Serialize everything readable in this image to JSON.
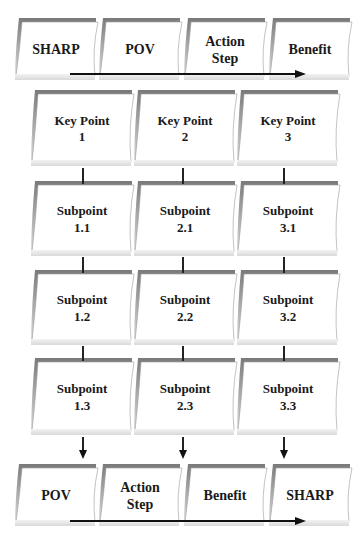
{
  "top_row": {
    "cards": [
      {
        "lines": [
          "SHARP",
          ""
        ]
      },
      {
        "lines": [
          "POV",
          ""
        ]
      },
      {
        "lines": [
          "Action",
          "Step"
        ]
      },
      {
        "lines": [
          "Benefit",
          ""
        ]
      }
    ]
  },
  "grid": {
    "columns": [
      {
        "cards": [
          {
            "lines": [
              "Key Point",
              "1"
            ]
          },
          {
            "lines": [
              "Subpoint",
              "1.1"
            ]
          },
          {
            "lines": [
              "Subpoint",
              "1.2"
            ]
          },
          {
            "lines": [
              "Subpoint",
              "1.3"
            ]
          }
        ]
      },
      {
        "cards": [
          {
            "lines": [
              "Key Point",
              "2"
            ]
          },
          {
            "lines": [
              "Subpoint",
              "2.1"
            ]
          },
          {
            "lines": [
              "Subpoint",
              "2.2"
            ]
          },
          {
            "lines": [
              "Subpoint",
              "2.3"
            ]
          }
        ]
      },
      {
        "cards": [
          {
            "lines": [
              "Key Point",
              "3"
            ]
          },
          {
            "lines": [
              "Subpoint",
              "3.1"
            ]
          },
          {
            "lines": [
              "Subpoint",
              "3.2"
            ]
          },
          {
            "lines": [
              "Subpoint",
              "3.3"
            ]
          }
        ]
      }
    ]
  },
  "bottom_row": {
    "cards": [
      {
        "lines": [
          "POV",
          ""
        ]
      },
      {
        "lines": [
          "Action",
          "Step"
        ]
      },
      {
        "lines": [
          "Benefit",
          ""
        ]
      },
      {
        "lines": [
          "SHARP",
          ""
        ]
      }
    ]
  },
  "colors": {
    "card_fill": "#ffffff",
    "card_shadow": "#8a8a8a",
    "card_base": "#e4e4e4",
    "connector": "#222222"
  }
}
